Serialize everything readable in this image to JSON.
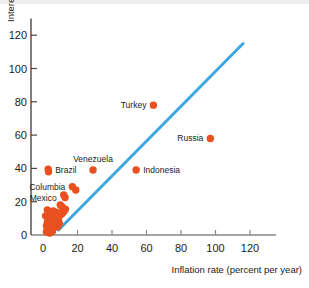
{
  "figure": {
    "background_color": "#ffffff",
    "top_strip_color": "#f0eeec"
  },
  "chart_data": {
    "type": "scatter",
    "title": "",
    "xlabel": "Inflation rate (percent per year)",
    "ylabel": "Interest rate percent per year",
    "xlim": [
      0,
      135
    ],
    "ylim": [
      0,
      130
    ],
    "xticks": [
      0,
      20,
      40,
      60,
      80,
      100,
      120
    ],
    "xtick_labels": [
      "0",
      "20",
      "40",
      "60",
      "80",
      "100",
      "120"
    ],
    "yticks": [
      0,
      20,
      40,
      60,
      80,
      100,
      120
    ],
    "ytick_labels": [
      "0",
      "20",
      "40",
      "60",
      "80",
      "100",
      "120"
    ],
    "grid": false,
    "legend": null,
    "marker_color": "#e8511f",
    "marker_size_px": 5,
    "reference_line": {
      "name": "45-degree line",
      "color": "#3ca7e0",
      "width_px": 3,
      "x_start": 9,
      "y_start": 3,
      "x_end": 116,
      "y_end": 115
    },
    "annotations": [
      {
        "label": "Turkey",
        "x": 64,
        "y": 78,
        "label_side": "left"
      },
      {
        "label": "Russia",
        "x": 97,
        "y": 58,
        "label_side": "left"
      },
      {
        "label": "Venezuela",
        "x": 29,
        "y": 39,
        "label_side": "above"
      },
      {
        "label": "Indonesia",
        "x": 54,
        "y": 39,
        "label_side": "right"
      },
      {
        "label": "Brazil",
        "x": 3,
        "y": 39,
        "label_side": "right"
      },
      {
        "label": "Columbia",
        "x": 17,
        "y": 29,
        "label_side": "left"
      },
      {
        "label": "Mexico",
        "x": 12,
        "y": 22,
        "label_side": "left"
      }
    ],
    "points": [
      {
        "x": 64,
        "y": 78
      },
      {
        "x": 97,
        "y": 58
      },
      {
        "x": 29,
        "y": 39
      },
      {
        "x": 54,
        "y": 39
      },
      {
        "x": 3,
        "y": 39.5
      },
      {
        "x": 3.2,
        "y": 38
      },
      {
        "x": 17,
        "y": 29
      },
      {
        "x": 19,
        "y": 27
      },
      {
        "x": 12,
        "y": 24
      },
      {
        "x": 12.8,
        "y": 22.5
      },
      {
        "x": 10,
        "y": 18
      },
      {
        "x": 11,
        "y": 17
      },
      {
        "x": 2.5,
        "y": 15
      },
      {
        "x": 3.5,
        "y": 14
      },
      {
        "x": 6,
        "y": 14.5
      },
      {
        "x": 7,
        "y": 13
      },
      {
        "x": 8,
        "y": 13.5
      },
      {
        "x": 9,
        "y": 12.5
      },
      {
        "x": 10,
        "y": 12
      },
      {
        "x": 11,
        "y": 12.8
      },
      {
        "x": 5,
        "y": 11
      },
      {
        "x": 6.5,
        "y": 10.5
      },
      {
        "x": 8,
        "y": 10
      },
      {
        "x": 3,
        "y": 9.5
      },
      {
        "x": 4,
        "y": 9
      },
      {
        "x": 5.5,
        "y": 8.5
      },
      {
        "x": 7,
        "y": 8
      },
      {
        "x": 2.5,
        "y": 7.5
      },
      {
        "x": 3.5,
        "y": 7
      },
      {
        "x": 4.5,
        "y": 6.5
      },
      {
        "x": 6,
        "y": 6.8
      },
      {
        "x": 7.5,
        "y": 6
      },
      {
        "x": 2,
        "y": 5.5
      },
      {
        "x": 3,
        "y": 5
      },
      {
        "x": 4,
        "y": 4.5
      },
      {
        "x": 5,
        "y": 4.8
      },
      {
        "x": 6,
        "y": 4
      },
      {
        "x": 2.5,
        "y": 3.5
      },
      {
        "x": 3.5,
        "y": 3
      },
      {
        "x": 4.5,
        "y": 2.8
      },
      {
        "x": 5.5,
        "y": 2.2
      },
      {
        "x": 2,
        "y": 2
      },
      {
        "x": 3,
        "y": 1.5
      },
      {
        "x": 4,
        "y": 1.2
      },
      {
        "x": 9,
        "y": 9.5
      },
      {
        "x": 9.5,
        "y": 7
      },
      {
        "x": 8.5,
        "y": 5
      },
      {
        "x": 1.5,
        "y": 11.5
      },
      {
        "x": 12,
        "y": 14
      },
      {
        "x": 13,
        "y": 15.5
      }
    ]
  }
}
